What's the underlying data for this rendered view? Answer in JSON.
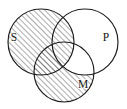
{
  "figure": {
    "kind": "venn-diagram",
    "width": 127,
    "height": 109,
    "background_color": "#ffffff",
    "stroke_color": "#1c1c1c",
    "hatch_color": "#4a4a4a"
  },
  "circles": [
    {
      "id": "S",
      "label": "S",
      "cx": 41,
      "cy": 42,
      "r": 33,
      "shaded": true,
      "label_x": 14,
      "label_y": 38
    },
    {
      "id": "P",
      "label": "P",
      "cx": 85,
      "cy": 42,
      "r": 33,
      "shaded": false,
      "label_x": 106,
      "label_y": 38
    },
    {
      "id": "M",
      "label": "M",
      "cx": 64,
      "cy": 72,
      "r": 30,
      "shaded": true,
      "label_x": 83,
      "label_y": 85
    }
  ],
  "shading": {
    "style": "diagonal-hatch",
    "angle_degrees": 45,
    "direction": "lower-left to upper-right",
    "spacing_px": 4,
    "line_width_px": 0.9,
    "shaded_regions": [
      "S-only",
      "S-and-P",
      "S-and-M",
      "S-and-P-and-M",
      "M-only"
    ],
    "unshaded_regions": [
      "P-only",
      "P-and-M-not-S"
    ]
  },
  "labels": {
    "subject": "S",
    "predicate": "P",
    "middle": "M"
  }
}
